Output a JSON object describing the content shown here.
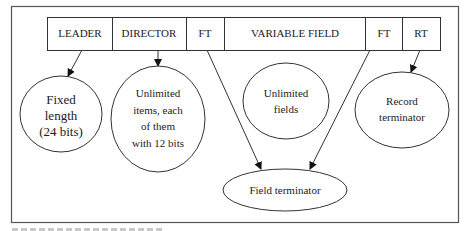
{
  "diagram": {
    "type": "record-structure",
    "record_bar": {
      "segments": [
        {
          "id": "leader",
          "label": "LEADER"
        },
        {
          "id": "director",
          "label": "DIRECTOR"
        },
        {
          "id": "ft1",
          "label": "FT"
        },
        {
          "id": "variable_field",
          "label": "VARIABLE FIELD"
        },
        {
          "id": "ft2",
          "label": "FT"
        },
        {
          "id": "rt",
          "label": "RT"
        }
      ]
    },
    "nodes": {
      "fixed_length": {
        "lines": [
          "Fixed",
          "length",
          "(24 bits)"
        ]
      },
      "director_items": {
        "lines": [
          "Unlimited",
          "items, each",
          "of them",
          "with 12 bits"
        ]
      },
      "unlimited_fields": {
        "lines": [
          "Unlimited",
          "fields"
        ]
      },
      "record_terminator": {
        "lines": [
          "Record",
          "terminator"
        ]
      },
      "field_terminator": {
        "lines": [
          "Field terminator"
        ]
      }
    },
    "edges": [
      {
        "from": "leader",
        "to": "fixed_length",
        "arrow": true
      },
      {
        "from": "director",
        "to": "director_items",
        "arrow": true
      },
      {
        "from": "ft1",
        "to": "field_terminator",
        "arrow": true
      },
      {
        "from": "ft2",
        "to": "field_terminator",
        "arrow": true
      },
      {
        "from": "rt",
        "to": "record_terminator",
        "arrow": true
      }
    ],
    "colors": {
      "stroke": "#333333",
      "frame": "#555555",
      "background": "#ffffff"
    }
  }
}
